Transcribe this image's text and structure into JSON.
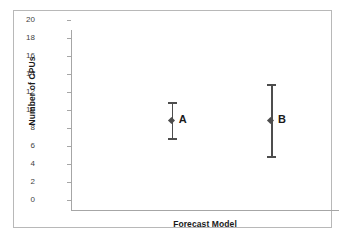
{
  "chart_data": {
    "type": "scatter",
    "title": "",
    "xlabel": "Forecast Model",
    "ylabel": "Number of CPUs",
    "ylim": [
      0,
      20
    ],
    "yticks": [
      20,
      18,
      16,
      14,
      12,
      10,
      8,
      6,
      4,
      2,
      0
    ],
    "ytick_labels": [
      "20",
      "18",
      "16",
      "14",
      "12",
      "10",
      "8",
      "6",
      "4",
      "2",
      "0"
    ],
    "grid": false,
    "legend": "none",
    "xtick_labels": [],
    "categories": [
      "A",
      "B"
    ],
    "series": [
      {
        "name": "A",
        "label": "A",
        "value": 10,
        "lower": 8,
        "upper": 12,
        "error_minus": 2,
        "error_plus": 2,
        "x_position_pct": 38
      },
      {
        "name": "B",
        "label": "B",
        "value": 10,
        "lower": 6,
        "upper": 14,
        "error_minus": 4,
        "error_plus": 4,
        "x_position_pct": 75
      }
    ],
    "colors": {
      "marker": "#4d4d4d",
      "error_bar": "#4d4d4d",
      "axis": "#a6a6a6",
      "text": "#1a1a1a",
      "tick_text": "#3f3f3f",
      "frame": "#b8b8b8",
      "background": "#ffffff"
    }
  }
}
